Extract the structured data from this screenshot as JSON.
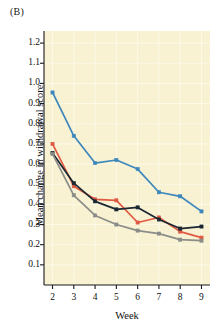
{
  "figure": {
    "panel_label": "(B)",
    "background_color": "#f8f1d2",
    "page_background": "#ffffff"
  },
  "chart_data": {
    "type": "line",
    "title": "",
    "panel": "(B)",
    "xlabel": "Week",
    "ylabel": "Mean change in withdrawal score",
    "x": [
      2,
      3,
      4,
      5,
      6,
      7,
      8,
      9
    ],
    "xticklabels": [
      "2",
      "3",
      "4",
      "5",
      "6",
      "7",
      "8",
      "9"
    ],
    "xlim": [
      1.6,
      9.4
    ],
    "ylim": [
      0.0,
      1.26
    ],
    "yticks": [
      0.1,
      0.2,
      0.3,
      0.4,
      0.5,
      0.6,
      0.7,
      0.8,
      0.9,
      1.0,
      1.1,
      1.2
    ],
    "yticklabels": [
      "0.1",
      "0.2",
      "0.3",
      "0.4",
      "0.5",
      "0.6",
      "0.7",
      "0.8",
      "0.9",
      "1.0",
      "1.1",
      "1.2"
    ],
    "grid": true,
    "grid_color": "#fdfbe8",
    "legend": "none",
    "marker": "square",
    "series": [
      {
        "name": "blue",
        "color": "#3d87bd",
        "values": [
          0.955,
          0.74,
          0.605,
          0.62,
          0.575,
          0.46,
          0.44,
          0.365
        ]
      },
      {
        "name": "red",
        "color": "#e05a43",
        "values": [
          0.7,
          0.49,
          0.425,
          0.42,
          0.31,
          0.335,
          0.265,
          0.235
        ]
      },
      {
        "name": "black",
        "color": "#1a2733",
        "values": [
          0.655,
          0.505,
          0.415,
          0.375,
          0.385,
          0.325,
          0.28,
          0.29
        ]
      },
      {
        "name": "gray",
        "color": "#8a8d88",
        "values": [
          0.65,
          0.445,
          0.345,
          0.3,
          0.27,
          0.255,
          0.225,
          0.22
        ]
      }
    ]
  }
}
